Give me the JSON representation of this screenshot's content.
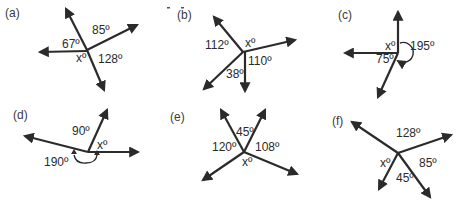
{
  "diagrams": [
    {
      "id": "a",
      "tag": "(a)",
      "angles": [
        "85º",
        "67º",
        "xº",
        "128º"
      ]
    },
    {
      "id": "b",
      "tag": "(b)",
      "angles": [
        "112º",
        "xº",
        "110º",
        "38º"
      ]
    },
    {
      "id": "c",
      "tag": "(c)",
      "angles": [
        "xº",
        "195º",
        "75º"
      ]
    },
    {
      "id": "d",
      "tag": "(d)",
      "angles": [
        "90º",
        "xº",
        "190º"
      ]
    },
    {
      "id": "e",
      "tag": "(e)",
      "angles": [
        "45º",
        "120º",
        "108º",
        "xº"
      ]
    },
    {
      "id": "f",
      "tag": "(f)",
      "angles": [
        "128º",
        "xº",
        "85º",
        "45º"
      ]
    }
  ],
  "colors": {
    "ink": "#2b2b2b",
    "background": "#ffffff"
  }
}
